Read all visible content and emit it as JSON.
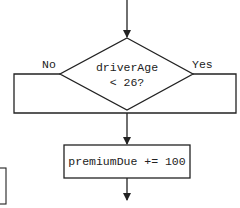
{
  "diagram": {
    "type": "flowchart",
    "decision": {
      "line1": "driverAge",
      "line2": "< 26?"
    },
    "branches": {
      "no_label": "No",
      "yes_label": "Yes"
    },
    "process": {
      "label": "premiumDue += 100"
    }
  }
}
